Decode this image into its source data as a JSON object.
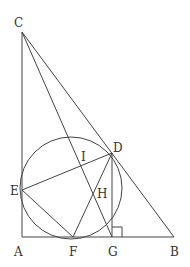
{
  "diagram": {
    "type": "geometry",
    "stroke_color": "#444444",
    "points": {
      "A": {
        "label": "A",
        "x": 22,
        "y": 237
      },
      "B": {
        "label": "B",
        "x": 174,
        "y": 236
      },
      "C": {
        "label": "C",
        "x": 22,
        "y": 32
      },
      "D": {
        "label": "D",
        "x": 112,
        "y": 153
      },
      "E": {
        "label": "E",
        "x": 22,
        "y": 190
      },
      "F": {
        "label": "F",
        "x": 73,
        "y": 236
      },
      "G": {
        "label": "G",
        "x": 112,
        "y": 236
      },
      "H": {
        "label": "H",
        "x": 93,
        "y": 193
      },
      "I": {
        "label": "I",
        "x": 81,
        "y": 166
      }
    },
    "segments": [
      "CA",
      "AB",
      "CB",
      "CG",
      "ED",
      "EF",
      "DF",
      "DG"
    ],
    "circle": {
      "cx": 71,
      "cy": 185,
      "r": 51
    },
    "right_angle_mark": {
      "at": "G"
    }
  }
}
